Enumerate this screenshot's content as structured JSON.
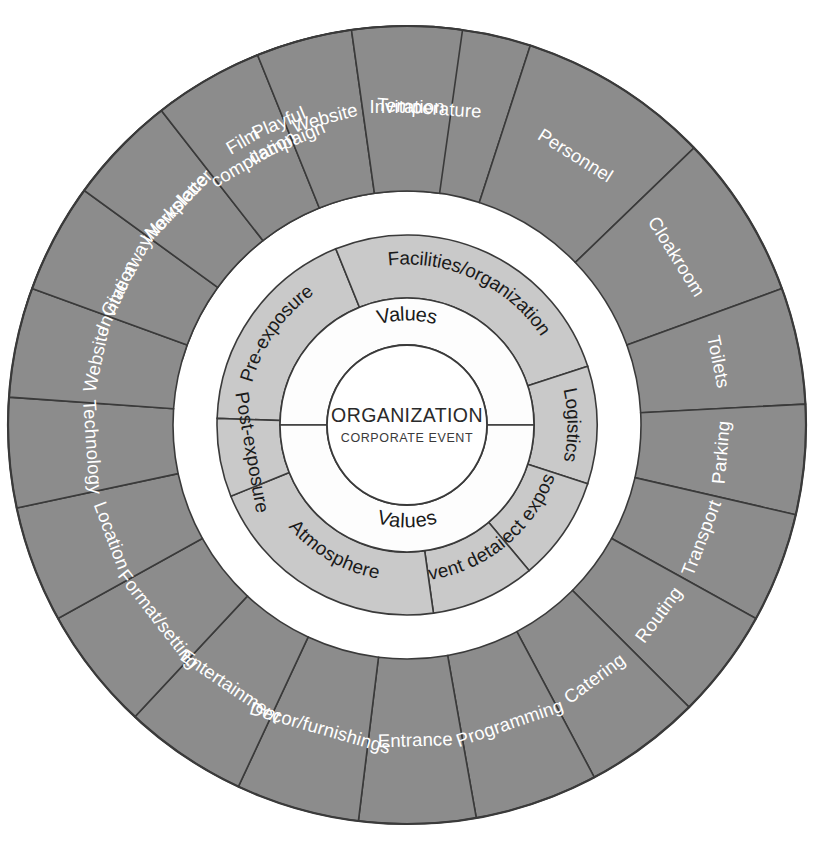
{
  "diagram": {
    "center": {
      "main": "ORGANIZATION",
      "sub": "CORPORATE EVENT"
    },
    "values_ring": {
      "top_label": "Values",
      "bottom_label": "Values"
    },
    "colors": {
      "outer_ring": "#8c8c8c",
      "mid_ring": "#c9c9c9",
      "values_ring": "#fdfdfd",
      "core": "#ffffff",
      "stroke": "#3a3a3a",
      "outer_label": "#ffffff",
      "mid_label": "#1a1a1a"
    },
    "mid_ring": [
      {
        "label": "Pre-exposure",
        "start": -88,
        "end": -22,
        "flip": false
      },
      {
        "label": "Facilities/organization",
        "start": -22,
        "end": 72,
        "flip": false
      },
      {
        "label": "Logistics",
        "start": 72,
        "end": 108,
        "flip": true
      },
      {
        "label": "Direct exposure",
        "start": 108,
        "end": 140,
        "flip": true
      },
      {
        "label": "Event details",
        "start": 140,
        "end": 172,
        "flip": false
      },
      {
        "label": "Atmosphere",
        "start": 172,
        "end": 248,
        "flip": false
      },
      {
        "label": "Post-exposure",
        "start": 248,
        "end": 272,
        "flip": false
      }
    ],
    "outer_ring": [
      {
        "label": "Invitation",
        "start": -74,
        "end": -58,
        "lines": 1
      },
      {
        "label": "Workplace",
        "start": -58,
        "end": -36,
        "lines": 1
      },
      {
        "label": "Playful campaign",
        "start": -36,
        "end": -10,
        "lines": 2
      },
      {
        "label": "Temperature",
        "start": -10,
        "end": 18,
        "lines": 1
      },
      {
        "label": "Personnel",
        "start": 18,
        "end": 46,
        "lines": 1
      },
      {
        "label": "Cloakroom",
        "start": 46,
        "end": 70,
        "lines": 1
      },
      {
        "label": "Toilets",
        "start": 70,
        "end": 87,
        "lines": 1
      },
      {
        "label": "Parking",
        "start": 87,
        "end": 103,
        "lines": 1
      },
      {
        "label": "Transport",
        "start": 103,
        "end": 119,
        "lines": 1
      },
      {
        "label": "Routing",
        "start": 119,
        "end": 135,
        "lines": 1
      },
      {
        "label": "Catering",
        "start": 135,
        "end": 152,
        "lines": 1
      },
      {
        "label": "Programming",
        "start": 152,
        "end": 170,
        "lines": 1
      },
      {
        "label": "Entrance",
        "start": 170,
        "end": 187,
        "lines": 1
      },
      {
        "label": "Decor/furnishings",
        "start": 187,
        "end": 205,
        "lines": 1
      },
      {
        "label": "Entertainment",
        "start": 205,
        "end": 223,
        "lines": 1
      },
      {
        "label": "Format/setting",
        "start": 223,
        "end": 241,
        "lines": 1
      },
      {
        "label": "Location",
        "start": 241,
        "end": 258,
        "lines": 1
      },
      {
        "label": "Technology",
        "start": 258,
        "end": 274,
        "lines": 1
      },
      {
        "label": "Website",
        "start": 274,
        "end": 290,
        "lines": 1
      },
      {
        "label": "Give-away",
        "start": 290,
        "end": 306,
        "lines": 1
      },
      {
        "label": "Newsletter",
        "start": 306,
        "end": 322,
        "lines": 1
      },
      {
        "label": "Film compilation",
        "start": 322,
        "end": 338,
        "lines": 2
      },
      {
        "label": "Website",
        "start": 338,
        "end": 352,
        "lines": 1
      },
      {
        "label": "Invitation",
        "start": 352,
        "end": 368,
        "lines": 1
      }
    ],
    "geometry": {
      "cx": 407,
      "cy": 425,
      "r_core": 80,
      "r_values": 127,
      "r_mid": 190,
      "r_outer_in": 234,
      "r_outer_out": 399
    }
  }
}
